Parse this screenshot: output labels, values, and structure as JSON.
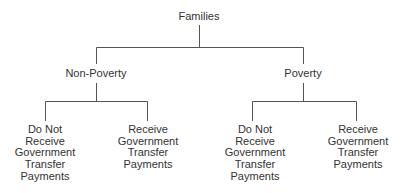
{
  "diagram": {
    "type": "tree",
    "line_color": "#555555",
    "root": {
      "label": "Families"
    },
    "level1": [
      {
        "label": "Non-Poverty"
      },
      {
        "label": "Poverty"
      }
    ],
    "level2": [
      {
        "parent": "Non-Poverty",
        "lines": [
          "Do Not",
          "Receive",
          "Government",
          "Transfer",
          "Payments"
        ]
      },
      {
        "parent": "Non-Poverty",
        "lines": [
          "Receive",
          "Government",
          "Transfer",
          "Payments"
        ]
      },
      {
        "parent": "Poverty",
        "lines": [
          "Do Not",
          "Receive",
          "Government",
          "Transfer",
          "Payments"
        ]
      },
      {
        "parent": "Poverty",
        "lines": [
          "Receive",
          "Government",
          "Transfer",
          "Payments"
        ]
      }
    ]
  }
}
